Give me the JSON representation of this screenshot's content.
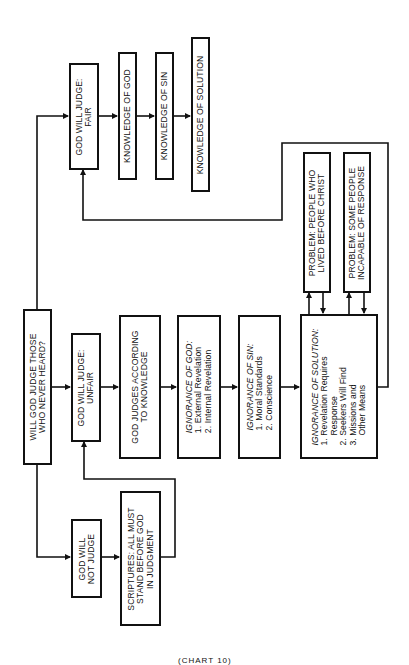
{
  "diagram": {
    "type": "flowchart",
    "orientation": "rotated-90-ccw",
    "root": {
      "lines": [
        "WILL GOD JUDGE THOSE",
        "WHO NEVER HEARD?"
      ]
    },
    "fair_branch": {
      "judge_fair": {
        "lines": [
          "GOD WILL JUDGE:",
          "FAIR"
        ]
      },
      "knowledge_of_god": {
        "lines": [
          "KNOWLEDGE OF GOD"
        ]
      },
      "knowledge_of_sin": {
        "lines": [
          "KNOWLEDGE OF SIN"
        ]
      },
      "knowledge_of_solution": {
        "lines": [
          "KNOWLEDGE OF SOLUTION"
        ]
      }
    },
    "unfair_branch": {
      "judge_unfair": {
        "lines": [
          "GOD WILL JUDGE:",
          "UNFAIR"
        ]
      },
      "judges_according": {
        "lines": [
          "GOD JUDGES ACCORDING",
          "TO KNOWLEDGE"
        ]
      },
      "ignorance_god": {
        "title": "IGNORANCE OF GOD:",
        "items": [
          "1.  External Revelation",
          "2.  Internal Revelation"
        ]
      },
      "ignorance_sin": {
        "title": "IGNORANCE OF SIN:",
        "items": [
          "1.  Moral Standards",
          "2.  Conscience"
        ]
      },
      "ignorance_solution": {
        "title": "IGNORANCE OF SOLUTION:",
        "items": [
          "1.  Revelation Requires",
          "Response",
          "2.  Seekers Will Find",
          "3.  Missions and",
          "Other Means"
        ]
      },
      "problem_before_christ": {
        "lines": [
          "PROBLEM: PEOPLE WHO",
          "LIVED BEFORE CHRIST"
        ]
      },
      "problem_incapable": {
        "lines": [
          "PROBLEM: SOME PEOPLE",
          "INCAPABLE OF RESPONSE"
        ]
      }
    },
    "not_judge_branch": {
      "not_judge": {
        "lines": [
          "GOD WILL",
          "NOT JUDGE"
        ]
      },
      "scriptures": {
        "lines": [
          "SCRIPTURES: ALL MUST",
          "STAND BEFORE GOD",
          "IN JUDGMENT"
        ]
      }
    },
    "caption": "(CHART 10)",
    "colors": {
      "ink": "#111111",
      "background": "#ffffff"
    }
  }
}
